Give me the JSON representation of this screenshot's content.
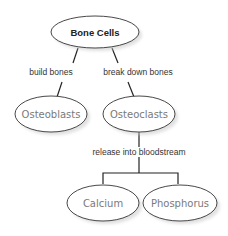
{
  "diagram": {
    "type": "concept-map",
    "root": {
      "id": "bone-cells",
      "label": "Bone Cells"
    },
    "nodes": [
      {
        "id": "osteoblasts",
        "label": "Osteoblasts"
      },
      {
        "id": "osteoclasts",
        "label": "Osteoclasts"
      },
      {
        "id": "calcium",
        "label": "Calcium"
      },
      {
        "id": "phosphorus",
        "label": "Phosphorus"
      }
    ],
    "edges": [
      {
        "from": "bone-cells",
        "to": "osteoblasts",
        "label": "build bones"
      },
      {
        "from": "bone-cells",
        "to": "osteoclasts",
        "label": "break down bones"
      },
      {
        "from": "osteoclasts",
        "to": [
          "calcium",
          "phosphorus"
        ],
        "label": "release into bloodstream"
      }
    ],
    "colors": {
      "line": "#222222",
      "node_text": "#7a7a7a",
      "root_text": "#222222",
      "shadow": "#c8c8c8"
    }
  }
}
